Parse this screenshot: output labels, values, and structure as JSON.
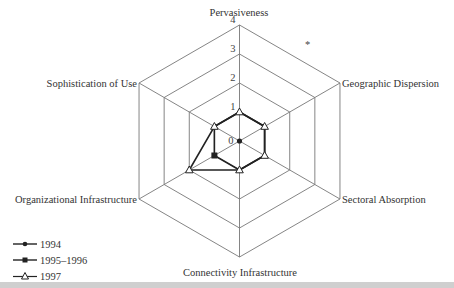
{
  "chart_data": {
    "type": "radar",
    "title": "",
    "axes": [
      "Pervasiveness",
      "Geographic Dispersion",
      "Sectoral Absorption",
      "Connectivity Infrastructure",
      "Organizational Infrastructure",
      "Sophistication of Use"
    ],
    "scale": {
      "min": 0,
      "max": 4,
      "ticks": [
        0,
        1,
        2,
        3,
        4
      ]
    },
    "grid": true,
    "legend_position": "bottom-left",
    "series": [
      {
        "name": "1994",
        "marker": "filled-circle",
        "values": [
          0,
          0,
          0,
          0,
          0,
          0
        ]
      },
      {
        "name": "1995–1996",
        "marker": "filled-square",
        "values": [
          1,
          1,
          1,
          1,
          1,
          1
        ]
      },
      {
        "name": "1997",
        "marker": "open-triangle",
        "values": [
          1,
          1,
          1,
          1,
          2,
          1
        ]
      }
    ]
  },
  "labels": {
    "axis_0": "Pervasiveness",
    "axis_1": "Geographic Dispersion",
    "axis_2": "Sectoral Absorption",
    "axis_3": "Connectivity Infrastructure",
    "axis_4": "Organizational Infrastructure",
    "axis_5": "Sophistication of Use",
    "tick_0": "0",
    "tick_1": "1",
    "tick_2": "2",
    "tick_3": "3",
    "tick_4": "4"
  },
  "legend": {
    "items": [
      {
        "label": "1994"
      },
      {
        "label": "1995–1996"
      },
      {
        "label": "1997"
      }
    ]
  },
  "colors": {
    "line": "#222222",
    "grid": "#777777",
    "band": "#cfcfcf"
  }
}
